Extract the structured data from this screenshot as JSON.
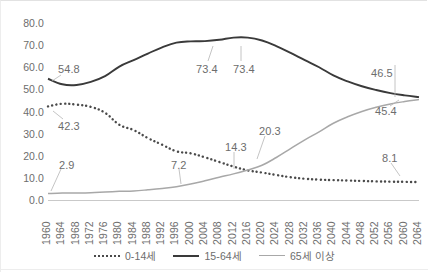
{
  "chart_data": {
    "type": "line",
    "title": "",
    "xlabel": "",
    "ylabel": "",
    "ylim": [
      0.0,
      80.0
    ],
    "grid": false,
    "legend_position": "bottom",
    "y_ticks": [
      "80.0",
      "70.0",
      "60.0",
      "50.0",
      "40.0",
      "30.0",
      "20.0",
      "10.0",
      "0.0"
    ],
    "y_tick_values": [
      80.0,
      70.0,
      60.0,
      50.0,
      40.0,
      30.0,
      20.0,
      10.0,
      0.0
    ],
    "categories": [
      "1960",
      "1964",
      "1968",
      "1972",
      "1976",
      "1980",
      "1984",
      "1988",
      "1992",
      "1996",
      "2000",
      "2004",
      "2008",
      "2012",
      "2016",
      "2020",
      "2024",
      "2028",
      "2032",
      "2036",
      "2040",
      "2044",
      "2048",
      "2052",
      "2056",
      "2060",
      "2064"
    ],
    "series": [
      {
        "name": "0-14세",
        "style": "dotted",
        "color": "#4a4a4a",
        "values": [
          42.3,
          43.5,
          43.1,
          42.1,
          39.4,
          34.0,
          31.6,
          28.0,
          25.0,
          22.0,
          21.1,
          19.3,
          17.2,
          15.1,
          13.4,
          12.4,
          11.3,
          10.3,
          9.6,
          9.2,
          9.0,
          8.8,
          8.6,
          8.4,
          8.3,
          8.2,
          8.1
        ]
      },
      {
        "name": "15-64세",
        "style": "solid",
        "color": "#3a3a3a",
        "values": [
          54.8,
          52.3,
          52.0,
          53.4,
          56.0,
          60.3,
          63.2,
          66.2,
          69.0,
          71.1,
          71.7,
          71.8,
          72.4,
          73.4,
          73.4,
          72.1,
          69.6,
          66.5,
          63.2,
          60.0,
          56.3,
          53.6,
          51.4,
          49.7,
          48.3,
          47.3,
          46.5
        ]
      },
      {
        "name": "65세 이상",
        "style": "solid",
        "color": "#a8a8a8",
        "values": [
          2.9,
          3.2,
          3.2,
          3.3,
          3.6,
          3.9,
          4.1,
          4.6,
          5.2,
          6.0,
          7.2,
          8.7,
          10.3,
          11.8,
          13.6,
          15.7,
          19.2,
          23.2,
          27.2,
          30.8,
          34.7,
          37.6,
          40.0,
          41.9,
          43.4,
          44.5,
          45.4
        ]
      }
    ],
    "annotations": [
      {
        "label": "54.8",
        "series": "15-64세",
        "year": "1960",
        "value": 54.8
      },
      {
        "label": "42.3",
        "series": "0-14세",
        "year": "1960",
        "value": 42.3
      },
      {
        "label": "2.9",
        "series": "65세 이상",
        "year": "1960",
        "value": 2.9
      },
      {
        "label": "7.2",
        "series": "65세 이상",
        "year": "2000",
        "value": 7.2
      },
      {
        "label": "14.3",
        "series": "0-14세",
        "year": "2017",
        "value": 14.3
      },
      {
        "label": "20.3",
        "series": "65세 이상",
        "year": "2025",
        "value": 20.3
      },
      {
        "label": "73.4",
        "series": "15-64세",
        "year": "2012",
        "value": 73.4
      },
      {
        "label": "73.4",
        "series": "15-64세",
        "year": "2016",
        "value": 73.4
      },
      {
        "label": "46.5",
        "series": "15-64세",
        "year": "2064",
        "value": 46.5
      },
      {
        "label": "45.4",
        "series": "65세 이상",
        "year": "2064",
        "value": 45.4
      },
      {
        "label": "8.1",
        "series": "0-14세",
        "year": "2064",
        "value": 8.1
      }
    ]
  },
  "legend": {
    "items": [
      {
        "label": "0-14세",
        "style": "dotted"
      },
      {
        "label": "15-64세",
        "style": "solid-dark"
      },
      {
        "label": "65세 이상",
        "style": "solid-gray"
      }
    ]
  }
}
